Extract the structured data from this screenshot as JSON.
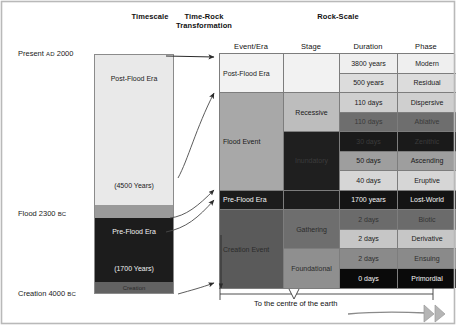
{
  "headers": {
    "timescale": "Timescale",
    "timerock": "Time-Rock\nTransformation",
    "timerock_line1": "Time-Rock",
    "timerock_line2": "Transformation",
    "rockscale": "Rock-Scale"
  },
  "axis_labels": [
    {
      "name": "present",
      "text_main": "Present ",
      "text_sc": "AD",
      "text_tail": " 2000"
    },
    {
      "name": "flood",
      "text_main": "Flood 2300 ",
      "text_sc": "BC",
      "text_tail": ""
    },
    {
      "name": "creation",
      "text_main": "Creation 4000 ",
      "text_sc": "BC",
      "text_tail": ""
    }
  ],
  "timescale_segments": [
    {
      "name": "post-flood-era",
      "label": "Post-Flood Era",
      "sublabel": "(4500 Years)",
      "color": "#e9e9e9",
      "text_color": "#1a1a1a"
    },
    {
      "name": "flood-band",
      "label": "",
      "sublabel": "",
      "color": "#9a9a9a",
      "text_color": "#1a1a1a"
    },
    {
      "name": "pre-flood-era",
      "label": "Pre-Flood Era",
      "sublabel": "(1700 Years)",
      "color": "#1c1c1c",
      "text_color": "#f2f2f2"
    },
    {
      "name": "creation-band",
      "label": "Creation",
      "sublabel": "",
      "color": "#626262",
      "text_color": "#2a2a2a"
    }
  ],
  "table": {
    "columns": [
      "Event/Era",
      "Stage",
      "Duration",
      "Phase"
    ],
    "events": [
      {
        "label": "Post-Flood Era",
        "color": "#f2f2f2",
        "text_color": "#1a1a1a"
      },
      {
        "label": "Flood Event",
        "color": "#a8a8a8",
        "text_color": "#1a1a1a"
      },
      {
        "label": "Pre-Flood Era",
        "color": "#1c1c1c",
        "text_color": "#f5f5f5"
      },
      {
        "label": "Creation Event",
        "color": "#5a5a5a",
        "text_color": "#2b2b2b"
      }
    ],
    "stages": [
      {
        "label": "",
        "color": "#f2f2f2",
        "text_color": "#1a1a1a"
      },
      {
        "label": "Recessive",
        "color": "#bdbdbd",
        "text_color": "#1a1a1a"
      },
      {
        "label": "Inundatory",
        "color": "#1f1f1f",
        "text_color": "#3c3c3c"
      },
      {
        "label": "",
        "color": "#1c1c1c",
        "text_color": "#f5f5f5"
      },
      {
        "label": "Gathering",
        "color": "#6e6e6e",
        "text_color": "#2b2b2b"
      },
      {
        "label": "Foundational",
        "color": "#8f8f8f",
        "text_color": "#2b2b2b"
      }
    ],
    "rows": [
      {
        "duration": "3800 years",
        "phase": "Modern",
        "color": "#efefef",
        "text_color": "#1a1a1a"
      },
      {
        "duration": "500 years",
        "phase": "Residual",
        "color": "#dcdcdc",
        "text_color": "#1a1a1a"
      },
      {
        "duration": "110 days",
        "phase": "Dispersive",
        "color": "#cfcfcf",
        "text_color": "#1a1a1a"
      },
      {
        "duration": "110 days",
        "phase": "Ablative",
        "color": "#6e6e6e",
        "text_color": "#3a3a3a"
      },
      {
        "duration": "30 days",
        "phase": "Zenithic",
        "color": "#1a1a1a",
        "text_color": "#3a3a3a"
      },
      {
        "duration": "50 days",
        "phase": "Ascending",
        "color": "#9e9e9e",
        "text_color": "#1a1a1a"
      },
      {
        "duration": "40 days",
        "phase": "Eruptive",
        "color": "#d6d6d6",
        "text_color": "#1a1a1a"
      },
      {
        "duration": "1700 years",
        "phase": "Lost-World",
        "color": "#141414",
        "text_color": "#f5f5f5"
      },
      {
        "duration": "2 days",
        "phase": "Biotic",
        "color": "#6b6b6b",
        "text_color": "#343434"
      },
      {
        "duration": "2 days",
        "phase": "Derivative",
        "color": "#c6c6c6",
        "text_color": "#1a1a1a"
      },
      {
        "duration": "2 days",
        "phase": "Ensuing",
        "color": "#8a8a8a",
        "text_color": "#2e2e2e"
      },
      {
        "duration": "0 days",
        "phase": "Primordial",
        "color": "#0a0a0a",
        "text_color": "#f5f5f5"
      }
    ]
  },
  "footer": {
    "centre_of_earth": "To the centre of the earth"
  },
  "colors": {
    "border": "#7d7d7d",
    "frame": "#9a9a9a",
    "arrow": "#2b2b2b"
  }
}
